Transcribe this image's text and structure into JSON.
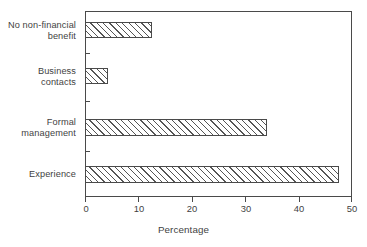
{
  "chart_data": {
    "type": "bar",
    "orientation": "horizontal",
    "title": "",
    "xlabel": "Percentage",
    "ylabel": "",
    "xlim": [
      0,
      50
    ],
    "xticks": [
      0,
      10,
      20,
      30,
      40,
      50
    ],
    "xtick_labels": [
      "0",
      "10",
      "20",
      "30",
      "40",
      "50"
    ],
    "grid": false,
    "legend": false,
    "categories": [
      "No non-financial\nbenefit",
      "Business\ncontacts",
      "Formal\nmanagement",
      "Experience"
    ],
    "values": [
      12.5,
      4.3,
      34.0,
      47.5
    ],
    "bar_fill": "hatched-diagonal",
    "bar_edge_color": "#4a4a4a",
    "bar_face_color": "#ffffff",
    "hatch_color": "#555555",
    "frame_color": "#4a4a4a",
    "text_color": "#3f3f3f",
    "background": "#ffffff"
  },
  "axis": {
    "x_title": "Percentage"
  }
}
